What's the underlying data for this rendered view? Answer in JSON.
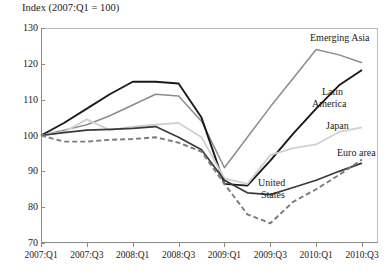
{
  "chart_data": {
    "type": "line",
    "title": "Index (2007:Q1 = 100)",
    "xlabel": "",
    "ylabel": "",
    "ylim": [
      70,
      130
    ],
    "yticks": [
      70,
      80,
      90,
      100,
      110,
      120,
      130
    ],
    "grid": false,
    "legend_position": "inline-right",
    "x": [
      "2007:Q1",
      "2007:Q2",
      "2007:Q3",
      "2007:Q4",
      "2008:Q1",
      "2008:Q2",
      "2008:Q3",
      "2008:Q4",
      "2009:Q1",
      "2009:Q2",
      "2009:Q3",
      "2009:Q4",
      "2010:Q1",
      "2010:Q2",
      "2010:Q3"
    ],
    "xticks": [
      "2007:Q1",
      "2007:Q3",
      "2008:Q1",
      "2008:Q3",
      "2009:Q1",
      "2009:Q3",
      "2010:Q1",
      "2010:Q3"
    ],
    "series": [
      {
        "name": "Emerging Asia",
        "color": "#8c8c8c",
        "style": "solid",
        "width": 1.5,
        "values": [
          100.0,
          101.5,
          103.0,
          105.5,
          108.5,
          111.5,
          111.0,
          104.0,
          91.0,
          99.5,
          108.0,
          116.0,
          124.0,
          122.5,
          120.3
        ]
      },
      {
        "name": "Latin America",
        "color": "#1a1a1a",
        "style": "solid",
        "width": 1.9,
        "values": [
          100.0,
          103.5,
          107.5,
          111.5,
          115.0,
          115.0,
          114.5,
          105.0,
          86.5,
          86.0,
          93.0,
          100.5,
          107.5,
          114.0,
          118.3
        ]
      },
      {
        "name": "Japan",
        "color": "#d0d0d0",
        "style": "solid",
        "width": 1.8,
        "values": [
          100.0,
          101.0,
          104.5,
          101.5,
          102.5,
          103.0,
          103.5,
          99.5,
          88.0,
          86.5,
          94.5,
          96.5,
          97.5,
          101.0,
          102.3
        ]
      },
      {
        "name": "Euro area",
        "color": "#3a3a3a",
        "style": "solid",
        "width": 1.7,
        "values": [
          100.0,
          100.8,
          101.5,
          101.7,
          102.0,
          102.5,
          99.5,
          96.0,
          87.5,
          84.0,
          83.5,
          85.5,
          87.5,
          90.0,
          92.3
        ]
      },
      {
        "name": "United States",
        "color": "#7a7a7a",
        "style": "dashed",
        "width": 1.9,
        "values": [
          100.0,
          98.3,
          98.3,
          98.8,
          99.0,
          99.5,
          98.0,
          95.5,
          86.5,
          78.0,
          75.5,
          81.5,
          85.0,
          89.0,
          93.3
        ]
      }
    ],
    "annotations": [
      {
        "text": "Emerging Asia",
        "x": 310,
        "y": 32
      },
      {
        "text": "Latin",
        "x": 322,
        "y": 86
      },
      {
        "text": "America",
        "x": 312,
        "y": 98
      },
      {
        "text": "Japan",
        "x": 326,
        "y": 120
      },
      {
        "text": "Euro area",
        "x": 337,
        "y": 147
      },
      {
        "text": "United",
        "x": 258,
        "y": 177
      },
      {
        "text": "States",
        "x": 261,
        "y": 189
      }
    ]
  }
}
